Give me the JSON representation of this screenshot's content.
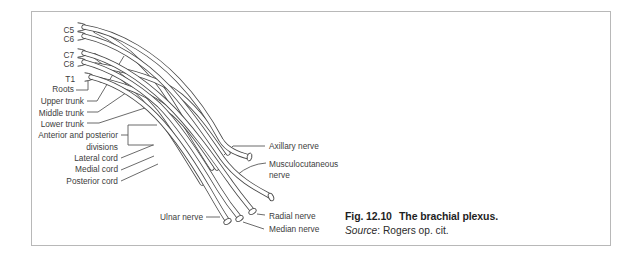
{
  "diagram": {
    "roots": {
      "c5": "C5",
      "c6": "C6",
      "c7": "C7",
      "c8": "C8",
      "t1": "T1"
    },
    "structures": {
      "roots_label": "Roots",
      "upper_trunk": "Upper trunk",
      "middle_trunk": "Middle trunk",
      "lower_trunk": "Lower trunk",
      "divisions_line1": "Anterior and posterior",
      "divisions_line2": "divisions",
      "lateral_cord": "Lateral cord",
      "medial_cord": "Medial cord",
      "posterior_cord": "Posterior cord"
    },
    "nerves": {
      "axillary": "Axillary nerve",
      "musculocutaneous_line1": "Musculocutaneous",
      "musculocutaneous_line2": "nerve",
      "ulnar": "Ulnar nerve",
      "radial": "Radial nerve",
      "median": "Median nerve"
    }
  },
  "caption": {
    "figure_number": "Fig. 12.10",
    "title": "The brachial plexus.",
    "source_label": "Source",
    "source_text": ": Rogers op. cit."
  },
  "colors": {
    "line": "#474747",
    "label_text": "#3d3d3d",
    "caption_text": "#1f1f1f",
    "frame_border": "#b8b8b8",
    "background": "#ffffff"
  }
}
